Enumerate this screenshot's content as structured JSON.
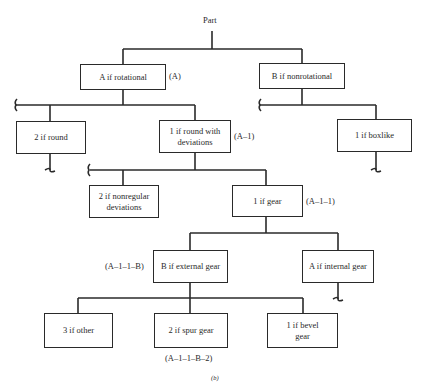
{
  "diagram": {
    "root": "Part",
    "caption": "(b)",
    "nodes": {
      "rotational": {
        "label": "A if rotational",
        "code": "(A)"
      },
      "nonrotational": {
        "label": "B if nonrotational"
      },
      "round": {
        "label": "2 if round"
      },
      "round_dev": {
        "label": "1 if round with deviations",
        "code": "(A–1)"
      },
      "boxlike": {
        "label": "1 if boxlike"
      },
      "nonregular": {
        "label": "2 if nonregular deviations"
      },
      "gear": {
        "label": "1 if gear",
        "code": "(A–1–1)"
      },
      "external": {
        "label": "B if external gear",
        "code": "(A–1–1–B)"
      },
      "internal": {
        "label": "A if internal gear"
      },
      "other": {
        "label": "3 if other"
      },
      "spur": {
        "label": "2 if spur gear",
        "code": "(A–1–1–B–2)"
      },
      "bevel": {
        "label": "1 if bevel gear"
      }
    },
    "edges": [
      [
        "Part",
        "A if rotational"
      ],
      [
        "Part",
        "B if nonrotational"
      ],
      [
        "A if rotational",
        "2 if round"
      ],
      [
        "A if rotational",
        "1 if round with deviations"
      ],
      [
        "B if nonrotational",
        "1 if boxlike"
      ],
      [
        "1 if round with deviations",
        "2 if nonregular deviations"
      ],
      [
        "1 if round with deviations",
        "1 if gear"
      ],
      [
        "1 if gear",
        "B if external gear"
      ],
      [
        "1 if gear",
        "A if internal gear"
      ],
      [
        "B if external gear",
        "3 if other"
      ],
      [
        "B if external gear",
        "2 if spur gear"
      ],
      [
        "B if external gear",
        "1 if bevel gear"
      ]
    ]
  }
}
